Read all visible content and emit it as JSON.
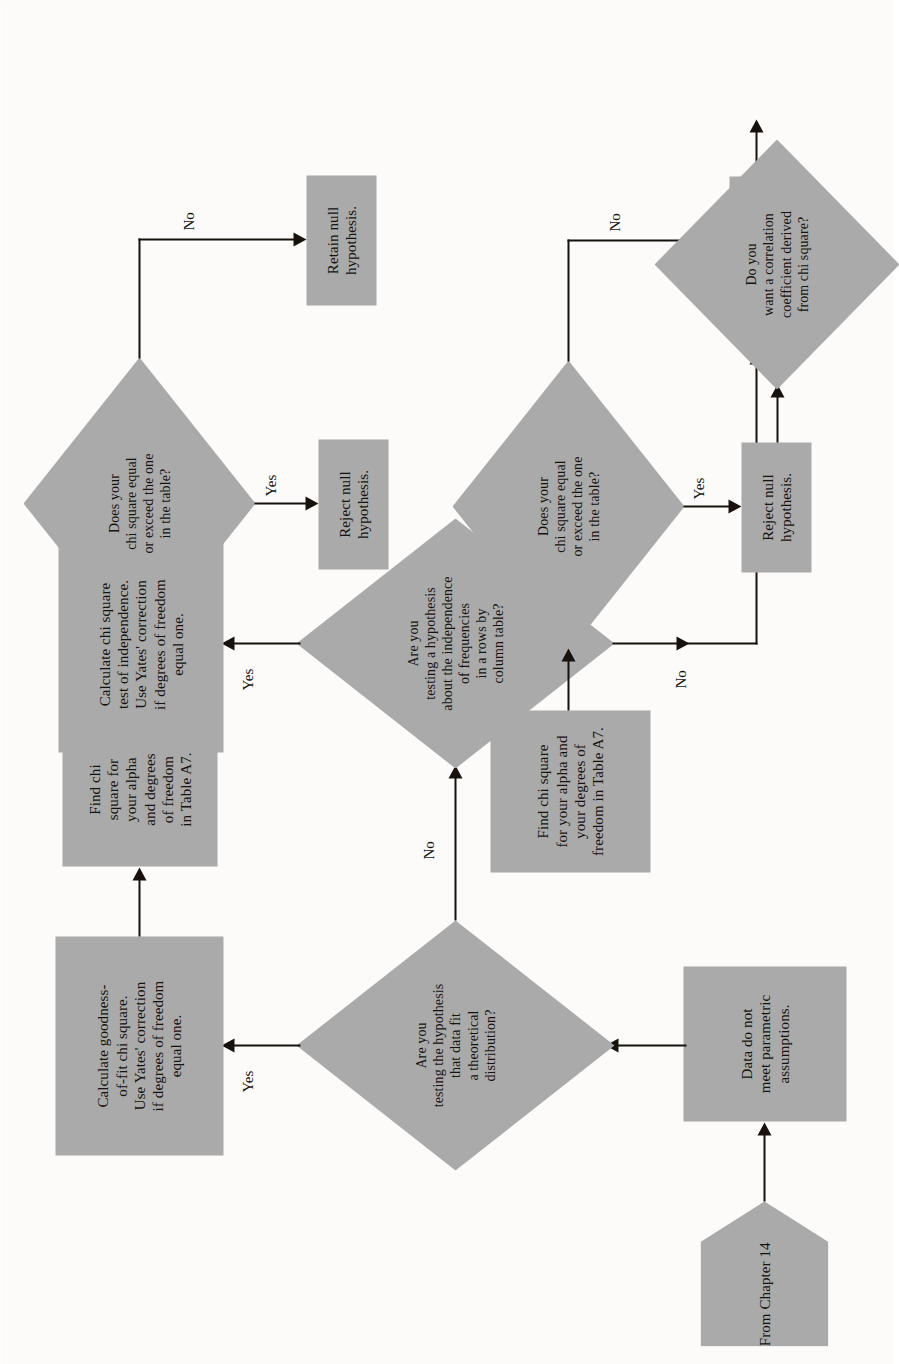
{
  "figure": {
    "orientation": "landscape-rotated-90ccw",
    "colors": {
      "node_fill": "#aaaaaa",
      "line": "#17120d",
      "page": "#fcfbf9",
      "text": "#15120f"
    }
  },
  "nodes": {
    "from_chapter": "From\nChapter 14",
    "data_not_parametric": "Data do not\nmeet parametric\nassumptions.",
    "q_goodness_fit": "Are you\ntesting the hypothesis\nthat data fit\na theoretical\ndistribution?",
    "calc_goodness_fit": "Calculate goodness-\nof-fit chi square.\nUse Yates' correction\nif degrees of freedom\nequal one.",
    "find_chi_1": "Find chi\nsquare for\nyour alpha\nand degrees\nof freedom\nin Table A7.",
    "q_exceed_1": "Does your\nchi square equal\nor exceed the one\nin the table?",
    "retain_null_1": "Retain null\nhypothesis.",
    "reject_null_1": "Reject null\nhypothesis.",
    "q_independence": "Are you\ntesting a hypothesis\nabout the independence\nof frequencies\nin a rows by\ncolumn table?",
    "calc_independence": "Calculate chi square\ntest of independence.\nUse Yates' correction\nif degrees of freedom\nequal one.",
    "find_chi_2": "Find chi square\nfor your alpha and\nyour degrees of\nfreedom in Table A7.",
    "q_exceed_2": "Does your\nchi square equal\nor exceed the one\nin the table?",
    "retain_null_2": "Retain null\nhypothesis.",
    "reject_null_2": "Reject null\nhypothesis.",
    "q_correlation": "Do you\nwant a correlation\ncoefficient derived\nfrom chi square?",
    "stop_1": "Stop",
    "q_2x2": "Is the\ncontingency\ntable 2 × 2?",
    "calc_contingency": "Calculate\ncontingency\ncoefficient.",
    "compute_phi": "Compute\nphi coefficient.",
    "stop_2": "Stop"
  },
  "edge_labels": {
    "goodness_yes": "Yes",
    "goodness_no": "No",
    "exceed1_yes": "Yes",
    "exceed1_no": "No",
    "independence_yes": "Yes",
    "independence_no": "No",
    "exceed2_yes": "Yes",
    "exceed2_no": "No",
    "correlation_yes": "Yes",
    "correlation_no": "No",
    "twobytwo_yes": "Yes",
    "twobytwo_no": "No"
  }
}
